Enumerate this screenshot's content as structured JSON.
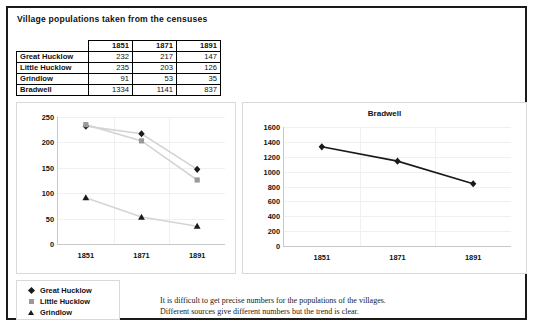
{
  "document": {
    "title": "Village populations taken from the censuses"
  },
  "table": {
    "corner_label": "",
    "columns": [
      "1851",
      "1871",
      "1891"
    ],
    "rows": [
      {
        "name": "Great Hucklow",
        "values": [
          "232",
          "217",
          "147"
        ]
      },
      {
        "name": "Little Hucklow",
        "values": [
          "235",
          "203",
          "126"
        ]
      },
      {
        "name": "Grindlow",
        "values": [
          "91",
          "53",
          "35"
        ]
      },
      {
        "name": "Bradwell",
        "values": [
          "1334",
          "1141",
          "837"
        ]
      }
    ]
  },
  "legend": {
    "items": [
      {
        "label": "Great Hucklow",
        "marker": "diamond-marker",
        "color": "#1a1a1a"
      },
      {
        "label": "Little Hucklow",
        "marker": "square-marker",
        "color": "#9a9a9a"
      },
      {
        "label": "Grindlow",
        "marker": "triangle-marker",
        "color": "#1a1a1a"
      }
    ]
  },
  "caption": {
    "line1": "It is difficult to get precise numbers for the populations of the villages.",
    "line2": "Different sources give different numbers but the trend is clear."
  },
  "chart_data": [
    {
      "type": "line",
      "id": "villages-chart",
      "title": "",
      "xlabel": "",
      "ylabel": "",
      "categories": [
        "1851",
        "1871",
        "1891"
      ],
      "ylim": [
        0,
        250
      ],
      "yticks": [
        0,
        50,
        100,
        150,
        200,
        250
      ],
      "grid": false,
      "legend_position": "below-left",
      "series": [
        {
          "name": "Great Hucklow",
          "values": [
            232,
            217,
            147
          ],
          "marker": "diamond",
          "color": "#1a1a1a",
          "line_color": "#d4d4d4"
        },
        {
          "name": "Little Hucklow",
          "values": [
            235,
            203,
            126
          ],
          "marker": "square",
          "color": "#9a9a9a",
          "line_color": "#d4d4d4"
        },
        {
          "name": "Grindlow",
          "values": [
            91,
            53,
            35
          ],
          "marker": "triangle",
          "color": "#1a1a1a",
          "line_color": "#d4d4d4"
        }
      ]
    },
    {
      "type": "line",
      "id": "bradwell-chart",
      "title": "Bradwell",
      "xlabel": "",
      "ylabel": "",
      "categories": [
        "1851",
        "1871",
        "1891"
      ],
      "ylim": [
        0,
        1600
      ],
      "yticks": [
        0,
        200,
        400,
        600,
        800,
        1000,
        1200,
        1400,
        1600
      ],
      "grid": false,
      "legend_position": "none",
      "series": [
        {
          "name": "Bradwell",
          "values": [
            1334,
            1141,
            837
          ],
          "marker": "diamond",
          "color": "#1a1a1a",
          "line_color": "#1a1a1a"
        }
      ]
    }
  ]
}
